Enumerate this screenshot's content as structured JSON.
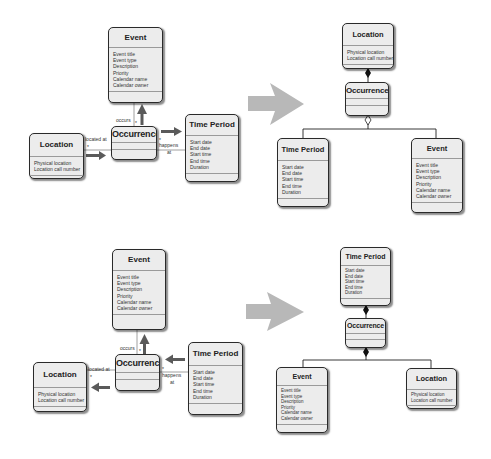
{
  "diagrams": {
    "top_left": {
      "event": {
        "title": "Event",
        "attrs": [
          "Event title",
          "Event type",
          "Description",
          "Priority",
          "Calendar name",
          "Calendar owner"
        ]
      },
      "occurrence": {
        "title": "Occurrence"
      },
      "location": {
        "title": "Location",
        "attrs": [
          "Physical location",
          "Location call number"
        ]
      },
      "time_period": {
        "title": "Time Period",
        "attrs": [
          "Start date",
          "End date",
          "Start time",
          "End time",
          "Duration"
        ]
      },
      "labels": {
        "occurs": "occurs",
        "located_at": "located at",
        "happens": "happens",
        "at": "at",
        "mult": "*"
      }
    },
    "top_right": {
      "location": {
        "title": "Location",
        "attrs": [
          "Physical location",
          "Location call number"
        ]
      },
      "occurrence": {
        "title": "Occurrence"
      },
      "time_period": {
        "title": "Time Period",
        "attrs": [
          "Start date",
          "End date",
          "Start time",
          "End time",
          "Duration"
        ]
      },
      "event": {
        "title": "Event",
        "attrs": [
          "Event title",
          "Event type",
          "Description",
          "Priority",
          "Calendar name",
          "Calendar owner"
        ]
      }
    },
    "bottom_left": {
      "event": {
        "title": "Event",
        "attrs": [
          "Event title",
          "Event type",
          "Description",
          "Priority",
          "Calendar name",
          "Calendar owner"
        ]
      },
      "occurrence": {
        "title": "Occurrence"
      },
      "location": {
        "title": "Location",
        "attrs": [
          "Physical location",
          "Location call number"
        ]
      },
      "time_period": {
        "title": "Time Period",
        "attrs": [
          "Start date",
          "End date",
          "Start time",
          "End time",
          "Duration"
        ]
      },
      "labels": {
        "occurs": "occurs",
        "located_at": "located at",
        "happens": "happens",
        "at": "at",
        "mult": "*"
      }
    },
    "bottom_right": {
      "time_period": {
        "title": "Time Period",
        "attrs": [
          "Start date",
          "End date",
          "Start time",
          "End time",
          "Duration"
        ]
      },
      "occurrence": {
        "title": "Occurrence"
      },
      "event": {
        "title": "Event",
        "attrs": [
          "Event title",
          "Event type",
          "Description",
          "Priority",
          "Calendar name",
          "Calendar owner"
        ]
      },
      "location": {
        "title": "Location",
        "attrs": [
          "Physical location",
          "Location call number"
        ]
      }
    }
  },
  "colors": {
    "box_fill": "#ececec",
    "box_border": "#2a2a2a",
    "arrow_dark": "#5a5a5a",
    "transform_arrow": "#b8b8b8"
  }
}
